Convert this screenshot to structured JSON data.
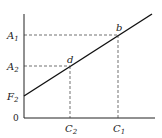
{
  "diagram": {
    "origin_label": "0",
    "y_labels": [
      {
        "main": "A",
        "sub": "1"
      },
      {
        "main": "A",
        "sub": "2"
      },
      {
        "main": "F",
        "sub": "2"
      }
    ],
    "x_labels": [
      {
        "main": "C",
        "sub": "2"
      },
      {
        "main": "C",
        "sub": "1"
      }
    ],
    "points": [
      {
        "label": "b"
      },
      {
        "label": "d"
      }
    ]
  }
}
